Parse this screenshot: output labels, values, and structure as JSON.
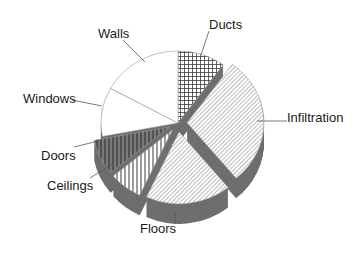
{
  "chart_data": {
    "type": "pie",
    "title": "",
    "style": "3d-exploded",
    "start_angle_deg": 0,
    "direction": "clockwise",
    "categories": [
      "Ducts",
      "Infiltration",
      "Floors",
      "Ceilings",
      "Doors",
      "Windows",
      "Walls"
    ],
    "values": [
      10,
      29,
      18,
      7,
      8,
      11,
      17
    ],
    "unit": "percent",
    "legend": "none (leader-line labels)",
    "slices": [
      {
        "label": "Ducts",
        "value": 10,
        "pattern": "crosshatch",
        "exploded": false
      },
      {
        "label": "Infiltration",
        "value": 29,
        "pattern": "diagonal",
        "exploded": true
      },
      {
        "label": "Floors",
        "value": 18,
        "pattern": "diagonal",
        "exploded": true
      },
      {
        "label": "Ceilings",
        "value": 7,
        "pattern": "vertical",
        "exploded": true
      },
      {
        "label": "Doors",
        "value": 8,
        "pattern": "vertical-dark",
        "exploded": true
      },
      {
        "label": "Windows",
        "value": 11,
        "pattern": "solid-white",
        "exploded": false
      },
      {
        "label": "Walls",
        "value": 17,
        "pattern": "solid-white",
        "exploded": false
      }
    ]
  },
  "labels": {
    "walls": "Walls",
    "ducts": "Ducts",
    "windows": "Windows",
    "infiltration": "Infiltration",
    "doors": "Doors",
    "ceilings": "Ceilings",
    "floors": "Floors"
  },
  "colors": {
    "background": "#ffffff",
    "depth": "#6e6e6e",
    "outline": "#9a9a9a",
    "hatch": "#3a3a3a",
    "text": "#1a1a1a"
  }
}
